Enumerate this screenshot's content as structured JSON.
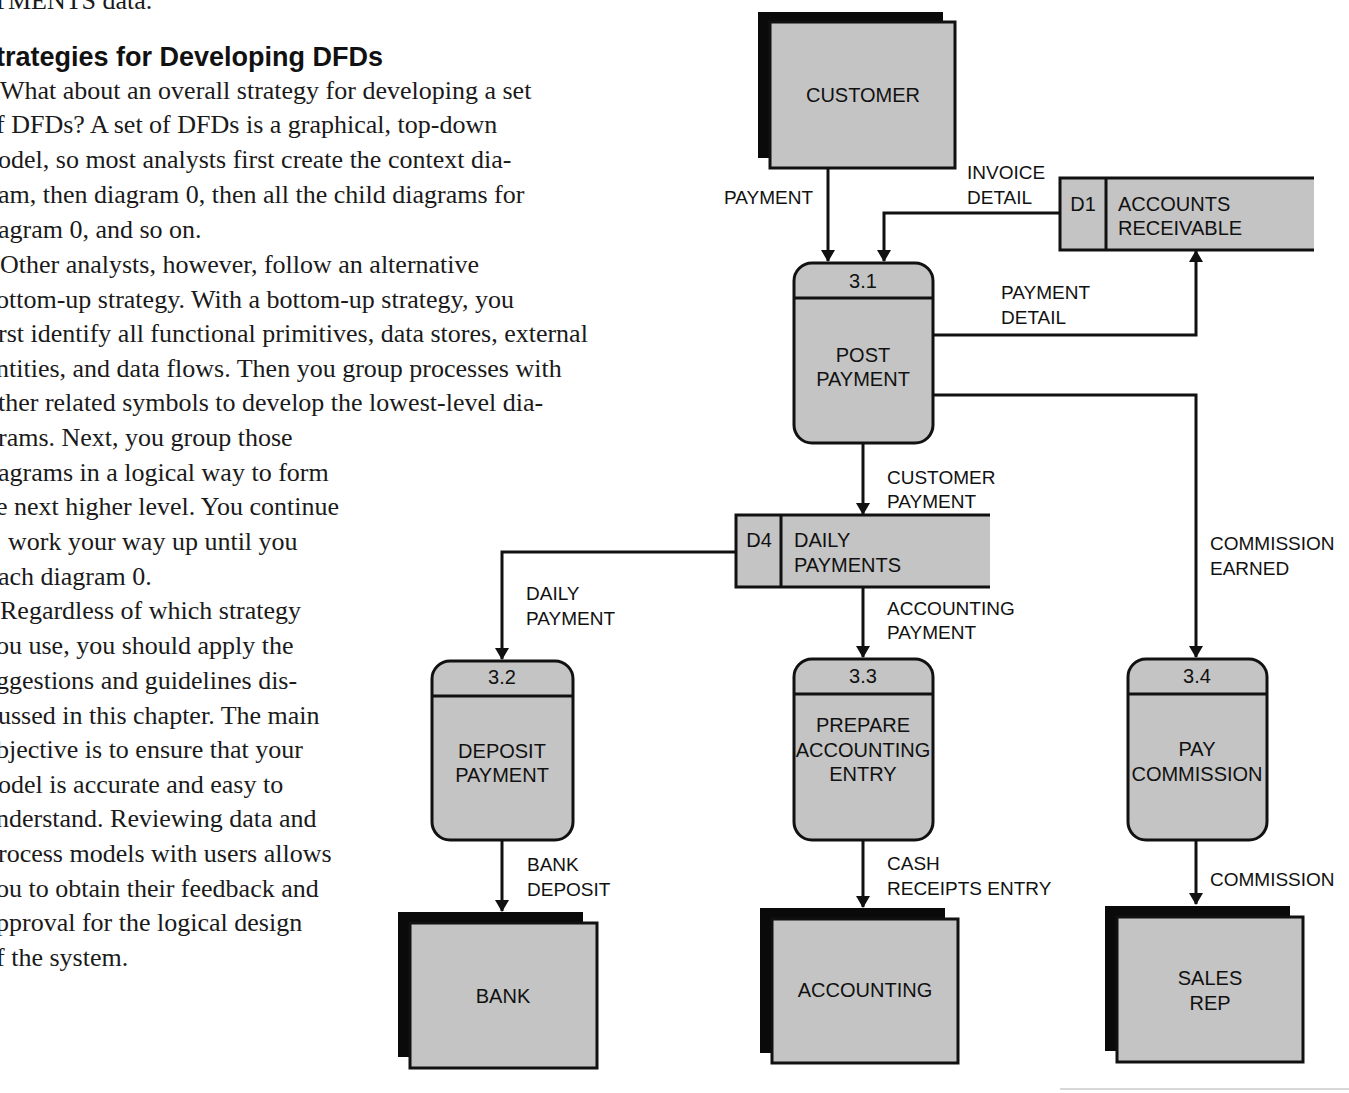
{
  "document": {
    "previous_text_fragment": "TMENTS data.",
    "section_heading": "trategies for Developing DFDs",
    "body_lines": [
      " What about an overall strategy for developing a set",
      "f DFDs? A set of DFDs is a graphical, top-down",
      "odel, so most analysts first create the context dia-",
      "am, then diagram 0, then all the child diagrams for",
      "agram 0, and so on.",
      " Other analysts, however, follow an alternative",
      "ottom-up strategy. With a bottom-up strategy, you",
      "rst identify all functional primitives, data stores, external",
      "ntities, and data flows. Then you group processes with",
      "ther related symbols to develop the lowest-level dia-",
      "rams. Next, you group those",
      "agrams in a logical way to form",
      "e next higher level. You continue",
      "work your way up until you",
      "ach diagram 0.",
      " Regardless of which strategy",
      "ou use, you should apply the",
      "ggestions and guidelines dis-",
      "ussed in this chapter. The main",
      "bjective is to ensure that your",
      "odel is accurate and easy to",
      "nderstand. Reviewing data and",
      "rocess models with users allows",
      "ou to obtain their feedback and",
      "pproval for the logical design",
      "f the system."
    ]
  },
  "diagram": {
    "colors": {
      "fill": "#c4c4c4",
      "stroke": "#111111",
      "shadow": "#0a0a0a"
    },
    "entities": {
      "customer": "CUSTOMER",
      "bank": "BANK",
      "accounting": "ACCOUNTING",
      "sales_rep_1": "SALES",
      "sales_rep_2": "REP"
    },
    "stores": {
      "d1": {
        "id": "D1",
        "line1": "ACCOUNTS",
        "line2": "RECEIVABLE"
      },
      "d4": {
        "id": "D4",
        "line1": "DAILY",
        "line2": "PAYMENTS"
      }
    },
    "processes": {
      "p31": {
        "id": "3.1",
        "line1": "POST",
        "line2": "PAYMENT"
      },
      "p32": {
        "id": "3.2",
        "line1": "DEPOSIT",
        "line2": "PAYMENT"
      },
      "p33": {
        "id": "3.3",
        "line1": "PREPARE",
        "line2": "ACCOUNTING",
        "line3": "ENTRY"
      },
      "p34": {
        "id": "3.4",
        "line1": "PAY",
        "line2": "COMMISSION"
      }
    },
    "flows": {
      "payment": "PAYMENT",
      "invoice_detail_1": "INVOICE",
      "invoice_detail_2": "DETAIL",
      "payment_detail_1": "PAYMENT",
      "payment_detail_2": "DETAIL",
      "customer_payment_1": "CUSTOMER",
      "customer_payment_2": "PAYMENT",
      "commission_earned_1": "COMMISSION",
      "commission_earned_2": "EARNED",
      "daily_payment_1": "DAILY",
      "daily_payment_2": "PAYMENT",
      "accounting_payment_1": "ACCOUNTING",
      "accounting_payment_2": "PAYMENT",
      "bank_deposit_1": "BANK",
      "bank_deposit_2": "DEPOSIT",
      "cash_receipts_1": "CASH",
      "cash_receipts_2": "RECEIPTS ENTRY",
      "commission": "COMMISSION"
    }
  }
}
